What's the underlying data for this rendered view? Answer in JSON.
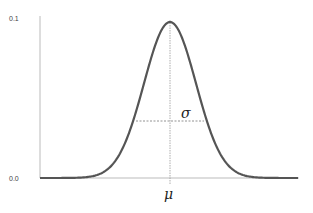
{
  "chart_data": {
    "type": "line",
    "title": "",
    "xlabel": "",
    "ylabel": "",
    "ylim": [
      0.0,
      0.1
    ],
    "y_ticks": [
      "0.1",
      "0.0"
    ],
    "grid": false,
    "series": [
      {
        "name": "normal distribution",
        "mean_label": "μ",
        "peak": 0.078,
        "color": "#555555"
      }
    ],
    "annotations": [
      {
        "label": "μ",
        "position": "x-axis at mean"
      },
      {
        "label": "σ",
        "position": "dashed horizontal line from mean to curve"
      }
    ]
  },
  "labels": {
    "y_top": "0.1",
    "y_bottom": "0.0",
    "mu": "μ",
    "sigma": "σ"
  }
}
